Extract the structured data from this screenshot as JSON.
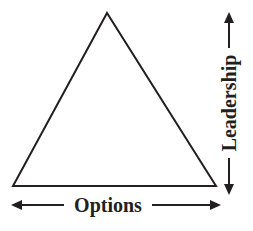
{
  "diagram": {
    "shape": "triangle",
    "stroke_color": "#231f20",
    "background": "#ffffff",
    "labels": {
      "horizontal": "Options",
      "vertical": "Leadership"
    }
  }
}
